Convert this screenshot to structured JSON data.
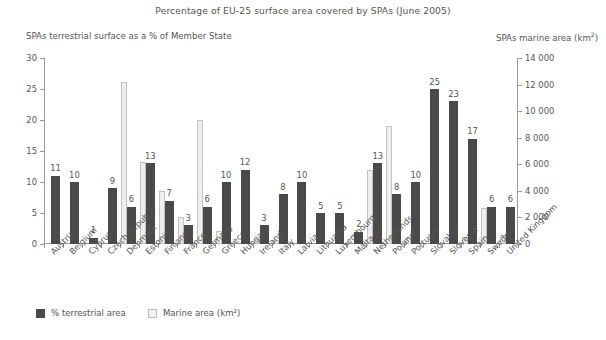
{
  "chart_data": {
    "type": "bar",
    "title": "Percentage of EU-25 surface area covered by SPAs (June 2005)",
    "left_axis_caption": "SPAs terrestrial surface as a % of Member State",
    "right_axis_caption": "SPAs marine area (km",
    "right_axis_caption_sup": "2",
    "right_axis_caption_tail": ")",
    "xlabel": "",
    "ylabel": "",
    "ylim": [
      0,
      30
    ],
    "y2lim": [
      0,
      14000
    ],
    "yticks": [
      "0",
      "5",
      "10",
      "15",
      "20",
      "25",
      "30"
    ],
    "ytick_values": [
      0,
      5,
      10,
      15,
      20,
      25,
      30
    ],
    "y2ticks": [
      "0",
      "2 000",
      "4 000",
      "6 000",
      "8 000",
      "10 000",
      "12 000",
      "14 000"
    ],
    "y2tick_values": [
      0,
      2000,
      4000,
      6000,
      8000,
      10000,
      12000,
      14000
    ],
    "grid": false,
    "legend_position": "bottom-left",
    "categories": [
      "Austria",
      "Belgium",
      "Cyprus",
      "Czech Republic",
      "Denmark",
      "Estonia",
      "Finland",
      "France",
      "Germany",
      "Greece",
      "Hungary",
      "Ireland",
      "Italy",
      "Latvia",
      "Lithuania",
      "Luxembourg",
      "Malta",
      "Netherlands",
      "Poland",
      "Portugal",
      "Slovakia",
      "Slovenia",
      "Spain",
      "Sweden",
      "United Kingdom"
    ],
    "series": [
      {
        "name": "% terrestrial area",
        "axis": "left",
        "color": "#4a4a4a",
        "values": [
          11,
          10,
          1,
          9,
          6,
          13,
          7,
          3,
          6,
          10,
          12,
          3,
          8,
          10,
          5,
          5,
          2,
          13,
          8,
          10,
          25,
          23,
          17,
          6,
          6
        ],
        "labels": [
          "11",
          "10",
          "1",
          "9",
          "6",
          "13",
          "7",
          "3",
          "6",
          "10",
          "12",
          "3",
          "8",
          "10",
          "5",
          "5",
          "2",
          "13",
          "8",
          "10",
          "25",
          "23",
          "17",
          "6",
          "6"
        ]
      },
      {
        "name": "Marine area (km²)",
        "axis": "right",
        "color": "#eeeeee",
        "values": [
          0,
          0,
          0,
          0,
          12200,
          6200,
          4000,
          2000,
          9300,
          1000,
          0,
          400,
          300,
          0,
          0,
          0,
          0,
          5600,
          8850,
          450,
          0,
          0,
          550,
          2700,
          700
        ]
      }
    ],
    "legend": [
      {
        "label": "% terrestrial area",
        "swatch": "terrestrial"
      },
      {
        "label": "Marine area (km²)",
        "swatch": "marine"
      }
    ]
  }
}
